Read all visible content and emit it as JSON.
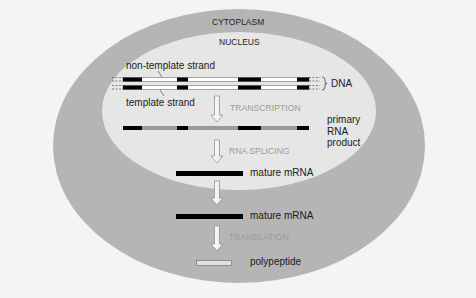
{
  "diagram": {
    "regions": {
      "outer": "CYTOPLASM",
      "inner": "NUCLEUS"
    },
    "dna": {
      "label": "DNA",
      "non_template_label": "non-template strand",
      "template_label": "template strand"
    },
    "steps": {
      "transcription": "TRANSCRIPTION",
      "splicing": "RNA SPLICING",
      "translation": "TRANSLATION"
    },
    "products": {
      "primary_rna": [
        "primary",
        "RNA",
        "product"
      ],
      "mature_mrna_nucleus": "mature mRNA",
      "mature_mrna_cytoplasm": "mature mRNA",
      "polypeptide": "polypeptide"
    },
    "colors": {
      "background": "#f3f3f3",
      "cytoplasm": "#b4b4b4",
      "nucleus": "#e6e6e6",
      "exon": "#000000",
      "intron_dna": "#ffffff",
      "intron_rna": "#999999",
      "step_text": "#9a9a9a"
    }
  }
}
